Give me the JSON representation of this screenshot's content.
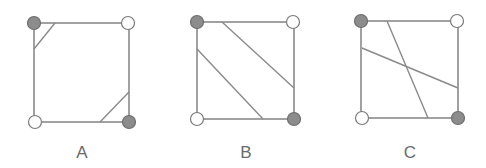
{
  "diagrams": [
    {
      "label": "A",
      "square": {
        "x1": 34,
        "y1": 23,
        "x2": 129,
        "y2": 122
      },
      "corners": [
        {
          "pos": "top-left",
          "x": 34,
          "y": 23,
          "filled": true
        },
        {
          "pos": "top-right",
          "x": 128,
          "y": 23,
          "filled": false
        },
        {
          "pos": "bottom-left",
          "x": 35,
          "y": 122,
          "filled": false
        },
        {
          "pos": "bottom-right",
          "x": 129,
          "y": 122,
          "filled": true
        }
      ],
      "lines": [
        {
          "x1": 55,
          "y1": 23,
          "x2": 34,
          "y2": 49
        },
        {
          "x1": 100,
          "y1": 122,
          "x2": 129,
          "y2": 92
        }
      ],
      "label_pos": {
        "x": 82,
        "y": 158
      }
    },
    {
      "label": "B",
      "square": {
        "x1": 197,
        "y1": 22,
        "x2": 294,
        "y2": 119
      },
      "corners": [
        {
          "pos": "top-left",
          "x": 197,
          "y": 22,
          "filled": true
        },
        {
          "pos": "top-right",
          "x": 293,
          "y": 22,
          "filled": false
        },
        {
          "pos": "bottom-left",
          "x": 197,
          "y": 119,
          "filled": false
        },
        {
          "pos": "bottom-right",
          "x": 294,
          "y": 119,
          "filled": true
        }
      ],
      "lines": [
        {
          "x1": 222,
          "y1": 22,
          "x2": 294,
          "y2": 88
        },
        {
          "x1": 197,
          "y1": 49,
          "x2": 263,
          "y2": 119
        }
      ],
      "label_pos": {
        "x": 246,
        "y": 158
      }
    },
    {
      "label": "C",
      "square": {
        "x1": 361,
        "y1": 21,
        "x2": 458,
        "y2": 118
      },
      "corners": [
        {
          "pos": "top-left",
          "x": 361,
          "y": 21,
          "filled": true
        },
        {
          "pos": "top-right",
          "x": 457,
          "y": 21,
          "filled": false
        },
        {
          "pos": "bottom-left",
          "x": 362,
          "y": 118,
          "filled": false
        },
        {
          "pos": "bottom-right",
          "x": 458,
          "y": 118,
          "filled": true
        }
      ],
      "lines": [
        {
          "x1": 387,
          "y1": 21,
          "x2": 428,
          "y2": 118
        },
        {
          "x1": 362,
          "y1": 48,
          "x2": 458,
          "y2": 88
        }
      ],
      "label_pos": {
        "x": 410,
        "y": 158
      }
    }
  ],
  "colors": {
    "edge": "#8a8a8a",
    "filled_vertex": "#8c8c8c",
    "empty_vertex": "#ffffff",
    "label": "#6a6a6a"
  }
}
